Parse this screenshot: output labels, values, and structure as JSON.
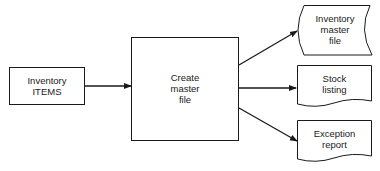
{
  "diagram": {
    "type": "system-flowchart",
    "nodes": {
      "input": {
        "line1": "Inventory",
        "line2": "ITEMS",
        "shape": "rectangle"
      },
      "process": {
        "line1": "Create",
        "line2": "master",
        "line3": "file",
        "shape": "rectangle"
      },
      "master_file": {
        "line1": "Inventory",
        "line2": "master",
        "line3": "file",
        "shape": "magnetic-tape"
      },
      "stock_listing": {
        "line1": "Stock",
        "line2": "listing",
        "shape": "document"
      },
      "exception_report": {
        "line1": "Exception",
        "line2": "report",
        "shape": "document"
      }
    },
    "edges": [
      {
        "from": "input",
        "to": "process"
      },
      {
        "from": "process",
        "to": "master_file"
      },
      {
        "from": "process",
        "to": "stock_listing"
      },
      {
        "from": "process",
        "to": "exception_report"
      }
    ],
    "stroke_color": "#1a1a1a"
  }
}
